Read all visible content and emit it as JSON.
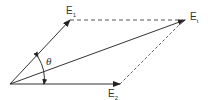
{
  "diagram": {
    "type": "vector parallelogram",
    "vectors": [
      {
        "name": "E1",
        "label": "E",
        "subscript": "1",
        "from": [
          10,
          84
        ],
        "to": [
          70,
          20
        ]
      },
      {
        "name": "E2",
        "label": "E",
        "subscript": "2",
        "from": [
          10,
          84
        ],
        "to": [
          120,
          84
        ]
      },
      {
        "name": "resultant",
        "label": "E",
        "subscript": "t",
        "from": [
          10,
          84
        ],
        "to": [
          185,
          20
        ]
      }
    ],
    "angle_label": "θ",
    "colors": {
      "line": "#333333",
      "dashed": "#666666"
    }
  }
}
